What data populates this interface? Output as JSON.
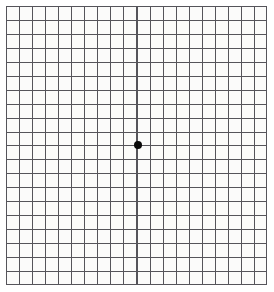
{
  "chart_data": {
    "type": "grid",
    "columns": 20,
    "rows": 20,
    "cell_width_px": 13.05,
    "cell_height_px": 13.95,
    "grid_left_px": 6,
    "grid_top_px": 6,
    "grid_width_px": 261,
    "grid_height_px": 279,
    "grid_on": true,
    "legend": "none",
    "xlabel": "",
    "ylabel": "",
    "annotations": [],
    "fixation_point": {
      "label": "central fixation dot",
      "x_px": 138,
      "y_px": 145,
      "diameter_px": 8,
      "grid_column_index": 10,
      "grid_row_index": 10
    }
  },
  "colors": {
    "background": "#ffffff",
    "grid_field": "#fbfbfa",
    "grid_line": "#55545a",
    "fixation_dot": "#0a0a0a"
  }
}
